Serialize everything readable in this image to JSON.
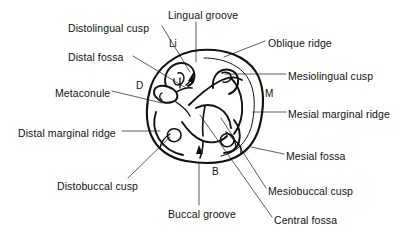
{
  "figure": {
    "stroke_color": "#111111",
    "background_color": "#ffffff",
    "leader_color": "#333333"
  },
  "labels": [
    {
      "id": "lingual-groove",
      "text": "Lingual groove",
      "x": 168,
      "y": 9
    },
    {
      "id": "distolingual-cusp",
      "text": "Distolingual cusp",
      "x": 68,
      "y": 22
    },
    {
      "id": "oblique-ridge",
      "text": "Oblique ridge",
      "x": 268,
      "y": 37
    },
    {
      "id": "distal-fossa",
      "text": "Distal fossa",
      "x": 68,
      "y": 51
    },
    {
      "id": "mesiolingual-cusp",
      "text": "Mesiolingual cusp",
      "x": 288,
      "y": 70
    },
    {
      "id": "metaconule",
      "text": "Metaconule",
      "x": 55,
      "y": 87
    },
    {
      "id": "mesial-marginal-ridge",
      "text": "Mesial marginal ridge",
      "x": 288,
      "y": 108
    },
    {
      "id": "distal-marginal-ridge",
      "text": "Distal marginal ridge",
      "x": 18,
      "y": 127
    },
    {
      "id": "mesial-fossa",
      "text": "Mesial fossa",
      "x": 286,
      "y": 150
    },
    {
      "id": "distobuccal-cusp",
      "text": "Distobuccal cusp",
      "x": 57,
      "y": 180
    },
    {
      "id": "mesiobuccal-cusp",
      "text": "Mesiobuccal cusp",
      "x": 268,
      "y": 185
    },
    {
      "id": "buccal-groove",
      "text": "Buccal groove",
      "x": 168,
      "y": 208
    },
    {
      "id": "central-fossa",
      "text": "Central fossa",
      "x": 274,
      "y": 214
    }
  ],
  "markers": [
    {
      "id": "lingual-marker",
      "text": "Li",
      "x": 169,
      "y": 38
    },
    {
      "id": "distal-marker",
      "text": "D",
      "x": 136,
      "y": 80
    },
    {
      "id": "mesial-marker",
      "text": "M",
      "x": 265,
      "y": 88
    },
    {
      "id": "buccal-marker",
      "text": "B",
      "x": 212,
      "y": 166
    }
  ],
  "legend_keys": {
    "Li": "Lingual",
    "D": "Distal",
    "M": "Mesial",
    "B": "Buccal"
  }
}
